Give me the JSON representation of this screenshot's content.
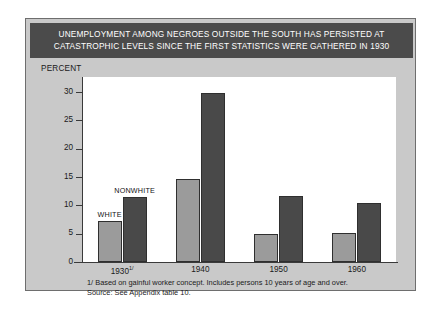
{
  "figure": {
    "title": "UNEMPLOYMENT AMONG NEGROES OUTSIDE THE SOUTH HAS PERSISTED AT\nCATASTROPHIC LEVELS SINCE THE FIRST STATISTICS WERE GATHERED IN 1930",
    "axis_label": "PERCENT",
    "footnotes": "1/ Based on gainful worker concept. Includes persons 10 years of age and over.\nSource: See Appendix table 10.",
    "colors": {
      "title_band": "#4b4b4b",
      "panel": "#c9c9c9",
      "white_series": "#9b9b9b",
      "nonwhite_series": "#494949"
    }
  },
  "chart_data": {
    "type": "bar",
    "title": "UNEMPLOYMENT AMONG NEGROES OUTSIDE THE SOUTH HAS PERSISTED AT CATASTROPHIC LEVELS SINCE THE FIRST STATISTICS WERE GATHERED IN 1930",
    "xlabel": "",
    "ylabel": "PERCENT",
    "ylim": [
      0,
      30
    ],
    "yticks": [
      0,
      5,
      10,
      15,
      20,
      25,
      30
    ],
    "grid": false,
    "legend_position": "inline-annotations",
    "categories": [
      "1930",
      "1940",
      "1950",
      "1960"
    ],
    "category_notes": [
      "1/",
      "",
      "",
      ""
    ],
    "series": [
      {
        "name": "WHITE",
        "values": [
          7.2,
          14.7,
          5.0,
          5.1
        ]
      },
      {
        "name": "NONWHITE",
        "values": [
          11.5,
          29.8,
          11.6,
          10.5
        ]
      }
    ]
  }
}
